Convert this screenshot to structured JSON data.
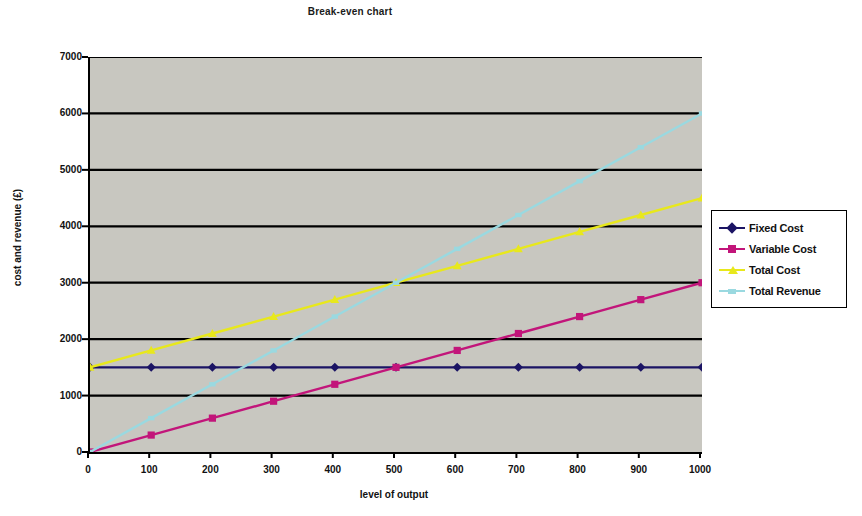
{
  "chart_data": {
    "type": "line",
    "title": "Break-even chart",
    "xlabel": "level of output",
    "ylabel": "cost and revenue (£)",
    "x": [
      0,
      100,
      200,
      300,
      400,
      500,
      600,
      700,
      800,
      900,
      1000
    ],
    "xlim": [
      0,
      1000
    ],
    "ylim": [
      0,
      7000
    ],
    "x_ticks": [
      "0",
      "100",
      "200",
      "300",
      "400",
      "500",
      "600",
      "700",
      "800",
      "900",
      "1000"
    ],
    "y_ticks": [
      "0",
      "1000",
      "2000",
      "3000",
      "4000",
      "5000",
      "6000",
      "7000"
    ],
    "grid": "horizontal",
    "legend_position": "right",
    "plot_background": "#c8c7c0",
    "series": [
      {
        "name": "Fixed Cost",
        "color": "#1b1464",
        "marker": "diamond",
        "values": [
          1500,
          1500,
          1500,
          1500,
          1500,
          1500,
          1500,
          1500,
          1500,
          1500,
          1500
        ]
      },
      {
        "name": "Variable Cost",
        "color": "#c2157a",
        "marker": "square",
        "values": [
          0,
          300,
          600,
          900,
          1200,
          1500,
          1800,
          2100,
          2400,
          2700,
          3000
        ]
      },
      {
        "name": "Total Cost",
        "color": "#e8e81c",
        "marker": "triangle",
        "values": [
          1500,
          1800,
          2100,
          2400,
          2700,
          3000,
          3300,
          3600,
          3900,
          4200,
          4500
        ]
      },
      {
        "name": "Total Revenue",
        "color": "#9ad9e0",
        "marker": "cross",
        "values": [
          0,
          600,
          1200,
          1800,
          2400,
          3000,
          3600,
          4200,
          4800,
          5400,
          6000
        ]
      }
    ],
    "annotations": [
      {
        "label": "break-even point",
        "x": 500,
        "y": 3000
      }
    ]
  }
}
